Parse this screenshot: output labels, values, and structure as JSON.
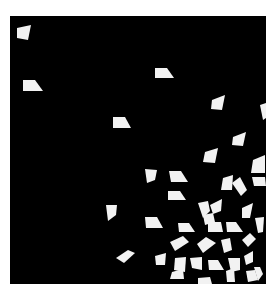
{
  "canvas": {
    "width": 273,
    "height": 290,
    "background": "#ffffff"
  },
  "panel": {
    "x": 10,
    "y": 16,
    "width": 256,
    "height": 268,
    "color": "#000000"
  },
  "shape_color": "#f2f2f2",
  "shapes": [
    "17,28 31,25 28,40 17,38",
    "23,80 35,80 43,91 23,91",
    "155,68 167,68 174,78 155,78",
    "113,117 125,117 131,128 113,128",
    "212,100 225,95 222,110 211,109",
    "260,105 266,103 266,118 263,120",
    "233,137 246,132 243,146 232,145",
    "205,152 218,148 215,163 203,162",
    "253,160 265,155 265,173 251,173",
    "252,177 265,177 266,186 254,186",
    "145,169 157,170 155,180 147,183",
    "169,171 181,171 188,182 171,182",
    "223,178 233,175 232,190 221,190",
    "232,183 240,177 247,190 241,196",
    "168,191 180,191 186,200 168,200",
    "198,203 208,201 210,211 203,218",
    "210,205 222,199 221,211 213,214",
    "242,208 253,203 250,218 242,218",
    "106,205 117,205 116,215 108,221",
    "145,217 157,217 163,228 146,228",
    "178,223 189,223 195,232 179,232",
    "203,215 213,213 215,222 205,225",
    "208,222 221,222 223,232 208,232",
    "226,222 236,222 243,232 227,232",
    "255,218 264,217 263,232 258,233",
    "170,242 183,236 189,242 175,251",
    "197,244 206,237 216,243 203,253",
    "221,240 230,238 232,250 224,253",
    "242,240 250,233 256,239 248,247",
    "116,258 128,250 135,253 124,263",
    "155,256 166,253 165,265 156,265",
    "175,258 186,257 185,272 174,270",
    "190,258 202,257 202,270 192,268",
    "208,260 218,260 224,270 209,270",
    "228,258 240,258 240,270 231,272",
    "244,256 253,251 253,262 246,265",
    "254,267 260,267 263,274 258,281",
    "172,272 183,269 184,279 170,279",
    "226,271 234,268 235,282 227,282",
    "246,271 255,270 258,280 248,282",
    "198,278 210,277 212,284 198,284"
  ]
}
